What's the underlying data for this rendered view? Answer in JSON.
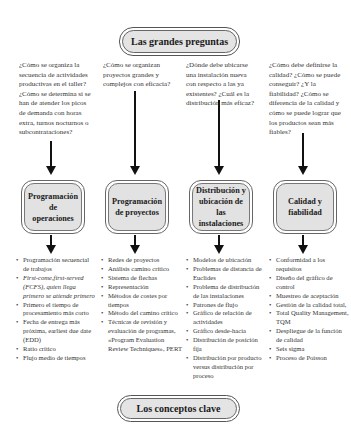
{
  "header": {
    "title": "Las grandes preguntas"
  },
  "footer": {
    "title": "Los conceptos clave"
  },
  "columns": [
    {
      "question": "¿Cómo se organiza la secuencia de actividades productivas en el taller? ¿Cómo se determina si se han de atender los picos de demanda con horas extra, turnos nocturnos o subcontrataciones?",
      "topic": "Programación de operaciones",
      "concepts": [
        "Programación secuencial de trabajos",
        "First-come,first-served (FCFS), quien llega primero se atiende primero",
        "Primero el tiempo de procesamiento más corto",
        "Fecha de entrega más próxima, earliest due date (EDD)",
        "Ratio crítico",
        "Flujo medio de tiempos"
      ]
    },
    {
      "question": "¿Cómo se organizan proyectos grandes y complejos con eficacia?",
      "topic": "Programación de proyectos",
      "concepts": [
        "Redes de proyectos",
        "Análisis camino crítico",
        "Sistema de flechas",
        "Representación",
        "Métodos de costes por tiempos",
        "Método del camino crítico",
        "Técnicas de revisión y evaluación de programas, «Program Evaluation Review Techniques», PERT"
      ]
    },
    {
      "question": "¿Dónde debe ubicarse una instalación nueva con respecto a las ya existentes? ¿Cuál es la distribución más eficaz?",
      "topic": "Distribución y ubicación de las instalaciones",
      "concepts": [
        "Modelos de ubicación",
        "Problemas de distancia de Euclides",
        "Problema de distribución de las instalaciones",
        "Patrones de flujo",
        "Gráfico de relación de actividades",
        "Gráfico desde-hacia",
        "Distribución de posición fija",
        "Distribución por producto versus distribución por proceso"
      ]
    },
    {
      "question": "¿Cómo debe definirse la calidad? ¿Cómo se puede conseguir? ¿Y la fiabilidad? ¿Cómo se diferencia de la calidad y cómo se puede lograr que los productos sean más fiables?",
      "topic": "Calidad y fiabilidad",
      "concepts": [
        "Conformidad a los requisitos",
        "Diseño del gráfico de control",
        "Muestreo de aceptación",
        "Gestión de la calidad total,",
        "Total Quality Management, TQM",
        "Despliegue de la función de calidad",
        "Seis sigma",
        "Proceso de Poisson"
      ]
    }
  ]
}
